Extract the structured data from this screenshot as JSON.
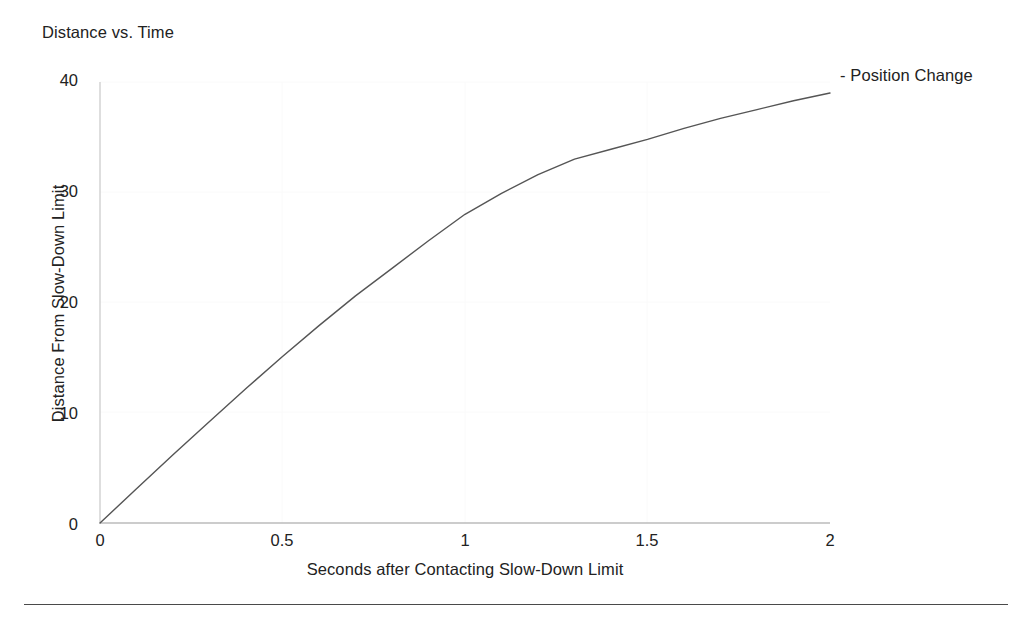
{
  "chart_data": {
    "type": "line",
    "title": "Distance vs. Time",
    "xlabel": "Seconds after Contacting Slow-Down Limit",
    "ylabel": "Distance From Slow-Down Limit",
    "xlim": [
      0,
      2
    ],
    "ylim": [
      0,
      40
    ],
    "grid": false,
    "legend_position": "top-right",
    "legend": [
      "- Position Change"
    ],
    "xticks": [
      "0",
      "0.5",
      "1",
      "1.5",
      "2"
    ],
    "xtick_values": [
      0,
      0.5,
      1,
      1.5,
      2
    ],
    "yticks": [
      "0",
      "10",
      "20",
      "30",
      "40"
    ],
    "ytick_values": [
      0,
      10,
      20,
      30,
      40
    ],
    "series": [
      {
        "name": "Position Change",
        "color": "#555555",
        "x": [
          0,
          0.1,
          0.2,
          0.3,
          0.4,
          0.5,
          0.6,
          0.7,
          0.8,
          0.9,
          1.0,
          1.1,
          1.2,
          1.3,
          1.4,
          1.5,
          1.6,
          1.7,
          1.8,
          1.9,
          2.0
        ],
        "values": [
          0,
          3.1,
          6.2,
          9.2,
          12.2,
          15.1,
          17.9,
          20.6,
          23.1,
          25.6,
          28.0,
          29.9,
          31.6,
          33.0,
          33.9,
          34.8,
          35.8,
          36.7,
          37.5,
          38.3,
          39.0
        ]
      }
    ]
  },
  "figure": {
    "title": "Distance vs. Time",
    "legend_label": "- Position Change",
    "x_axis_title": "Seconds after Contacting Slow-Down Limit",
    "y_axis_title": "Distance From Slow-Down Limit",
    "x_tick_labels": [
      "0",
      "0.5",
      "1",
      "1.5",
      "2"
    ],
    "y_tick_labels": [
      "0",
      "10",
      "20",
      "30",
      "40"
    ],
    "line_color": "#555555",
    "axis_color": "#b4b4b4",
    "background_color": "#ffffff",
    "rule_color": "#4a4a4a"
  }
}
